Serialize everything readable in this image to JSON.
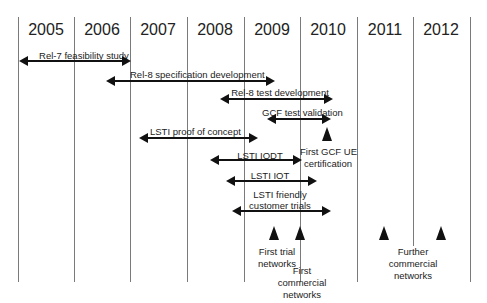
{
  "diagram": {
    "title": "",
    "years": [
      "2005",
      "2006",
      "2007",
      "2008",
      "2009",
      "2010",
      "2011",
      "2012"
    ],
    "activities": [
      {
        "label": "Rel-7 feasibility study",
        "start": 2005.0,
        "end": 2006.9
      },
      {
        "label": "Rel-8 specification development",
        "start": 2006.1,
        "end": 2009.0
      },
      {
        "label": "Rel-8 test development",
        "start": 2008.0,
        "end": 2010.2
      },
      {
        "label": "GCF test validation",
        "start": 2009.5,
        "end": 2010.2
      },
      {
        "label": "LSTI proof of concept",
        "start": 2007.0,
        "end": 2008.8
      },
      {
        "label": "LSTI IODT",
        "start": 2008.0,
        "end": 2009.5
      },
      {
        "label": "LSTI IOT",
        "start": 2008.3,
        "end": 2009.6
      },
      {
        "label": "LSTI friendly customer trials",
        "start": 2008.3,
        "end": 2009.6
      }
    ],
    "milestones": [
      {
        "label": "First GCF UE certification",
        "year": 2010.0
      },
      {
        "label": "First trial networks",
        "year": 2008.7
      },
      {
        "label": "First commercial networks",
        "year": 2009.5
      },
      {
        "label": "Further commercial networks",
        "year": 2011.0
      },
      {
        "label": "Further commercial networks",
        "year": 2012.0
      }
    ]
  },
  "labels": {
    "rel7": "Rel-7 feasibility study",
    "rel8spec": "Rel-8 specification development",
    "rel8test": "Rel-8 test development",
    "gcf": "GCF test validation",
    "lsti_poc": "LSTI proof of concept",
    "lsti_iodt": "LSTI IODT",
    "lsti_iot": "LSTI IOT",
    "lsti_fct_1": "LSTI friendly",
    "lsti_fct_2": "customer trials",
    "gcf_ue_1": "First GCF UE",
    "gcf_ue_2": "certification",
    "trial_1": "First trial",
    "trial_2": "networks",
    "commercial_1": "First",
    "commercial_2": "commercial",
    "commercial_3": "networks",
    "further_1": "Further",
    "further_2": "commercial",
    "further_3": "networks"
  }
}
